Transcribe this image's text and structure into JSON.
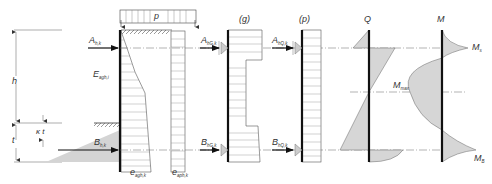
{
  "figure": {
    "colors": {
      "line": "#222222",
      "thin_line": "#555555",
      "fill_gray": "#d4d4d4",
      "dash": "#555555"
    }
  },
  "dimensions": {
    "h": "h",
    "t": "t",
    "kt": "κ t"
  },
  "wall_diagram": {
    "load_label": "p",
    "anchor_top": {
      "base": "A",
      "sub": "h,k"
    },
    "anchor_bottom": {
      "base": "B",
      "sub": "h,k"
    },
    "earth_pressure": {
      "base": "E",
      "sub": "agh,i"
    },
    "bottom_label_1": {
      "base": "e",
      "sub": "agh,k"
    },
    "bottom_label_2": {
      "base": "e",
      "sub": "aph,k"
    }
  },
  "g_diagram": {
    "title": "(g)",
    "anchor_top": {
      "base": "A",
      "sub": "hG,k"
    },
    "anchor_bottom": {
      "base": "B",
      "sub": "hG,k"
    }
  },
  "p_diagram": {
    "title": "(p)",
    "anchor_top": {
      "base": "A",
      "sub": "hQ,k"
    },
    "anchor_bottom": {
      "base": "B",
      "sub": "hQ,k"
    }
  },
  "shear_diagram": {
    "title": "Q"
  },
  "moment_diagram": {
    "title": "M",
    "top_label": {
      "base": "M",
      "sub": "s"
    },
    "max_label": {
      "base": "M",
      "sub": "max"
    },
    "bottom_label": {
      "base": "M",
      "sub": "B"
    }
  }
}
